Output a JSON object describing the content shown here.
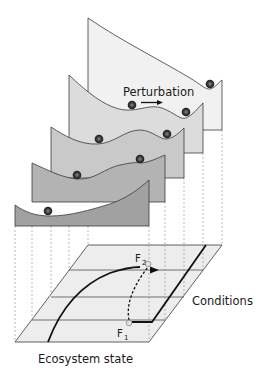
{
  "figure": {
    "type": "stability-landscape-diagram",
    "labels": {
      "perturbation": "Perturbation",
      "conditions": "Conditions",
      "ecosystem_state": "Ecosystem state",
      "f2_main": "F",
      "f2_sub": "2",
      "f1_main": "F",
      "f1_sub": "1"
    },
    "landscapes": [
      {
        "id": "landscape-1",
        "fill": "#f1f1f1",
        "balls": 1
      },
      {
        "id": "landscape-2",
        "fill": "#dcdcdc",
        "balls": 2
      },
      {
        "id": "landscape-3",
        "fill": "#c9c9c9",
        "balls": 2
      },
      {
        "id": "landscape-4",
        "fill": "#b3b3b3",
        "balls": 2
      },
      {
        "id": "landscape-5",
        "fill": "#a1a1a1",
        "balls": 1
      }
    ],
    "floor": {
      "fill": "#ededed",
      "rows": 4
    },
    "colors": {
      "ball": "#2b2b2b",
      "ball_highlight": "#6e6e6e",
      "line": "#111111",
      "marker_stroke": "#9a9a9a"
    }
  }
}
